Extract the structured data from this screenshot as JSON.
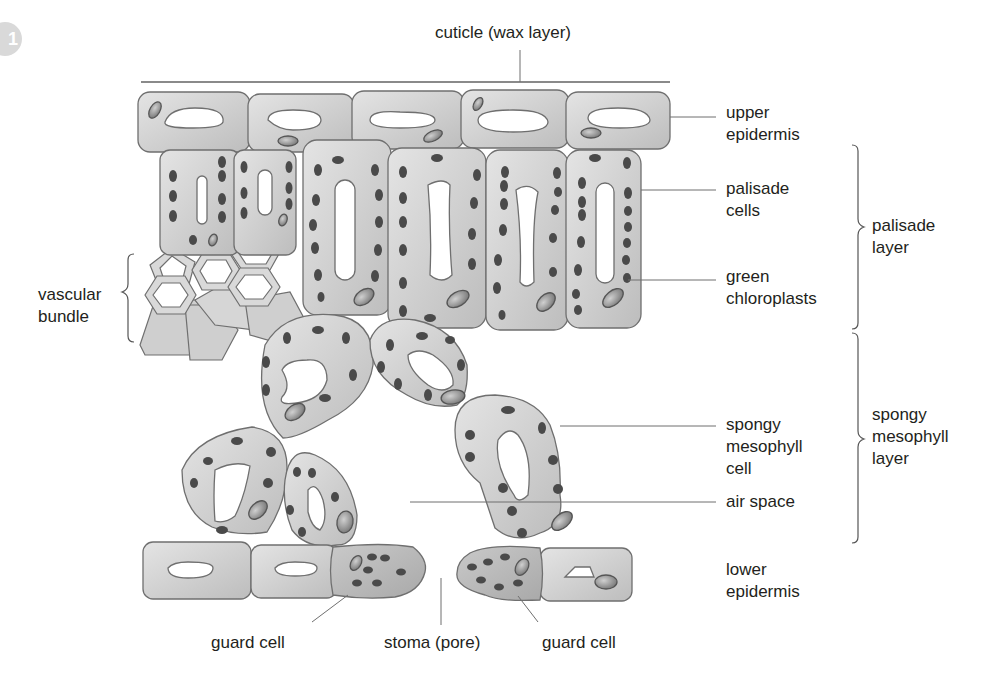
{
  "figure": {
    "badge": "1",
    "colors": {
      "cell_fill": "#cfcfcf",
      "cell_stroke": "#6f6f6f",
      "vacuole": "#ffffff",
      "chloroplast": "#4a4a4a",
      "nucleus": "#9a9a9a",
      "leader_line": "#6f6f6f",
      "text": "#231f20"
    }
  },
  "labels": {
    "cuticle": "cuticle (wax layer)",
    "upper_epidermis": [
      "upper",
      "epidermis"
    ],
    "palisade_cells": [
      "palisade",
      "cells"
    ],
    "green_chloroplasts": [
      "green",
      "chloroplasts"
    ],
    "palisade_layer": [
      "palisade",
      "layer"
    ],
    "vascular_bundle": [
      "vascular",
      "bundle"
    ],
    "spongy_mesophyll_cell": [
      "spongy",
      "mesophyll",
      "cell"
    ],
    "air_space": "air space",
    "spongy_mesophyll_layer": [
      "spongy",
      "mesophyll",
      "layer"
    ],
    "lower_epidermis": [
      "lower",
      "epidermis"
    ],
    "guard_cell_left": "guard cell",
    "stoma": "stoma (pore)",
    "guard_cell_right": "guard cell"
  }
}
